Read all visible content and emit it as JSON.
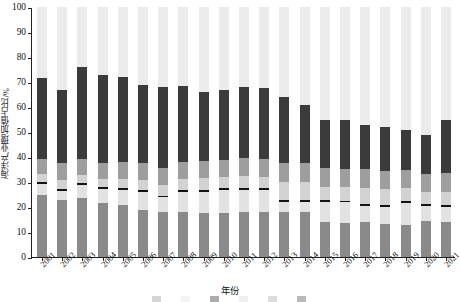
{
  "chart_data": {
    "type": "bar",
    "subtype": "stacked-bar-100",
    "title": "",
    "xlabel": "年份",
    "ylabel": "海洋产业增加值占比/%",
    "ylim": [
      0,
      100
    ],
    "ytick_labels": [
      "0",
      "10",
      "20",
      "30",
      "40",
      "50",
      "60",
      "70",
      "80",
      "90",
      "100"
    ],
    "ytick_values": [
      0,
      10,
      20,
      30,
      40,
      50,
      60,
      70,
      80,
      90,
      100
    ],
    "grid": false,
    "legend_position": "bottom",
    "legend_note": "legend row is cropped off the bottom edge of the screenshot and is illegible",
    "categories": [
      "2001",
      "2002",
      "2003",
      "2004",
      "2005",
      "2006",
      "2007",
      "2008",
      "2009",
      "2010",
      "2011",
      "2012",
      "2013",
      "2014",
      "2015",
      "2016",
      "2017",
      "2018",
      "2019",
      "2020",
      "2021"
    ],
    "series": [
      {
        "name": "series-1",
        "color": "#8a8a8a",
        "values": [
          24.8,
          22.9,
          23.7,
          21.5,
          20.7,
          18.7,
          18.1,
          18.2,
          17.6,
          17.8,
          17.9,
          18.2,
          18.0,
          18.1,
          13.9,
          13.8,
          13.9,
          13.4,
          12.7,
          14.6,
          14.2
        ]
      },
      {
        "name": "series-2",
        "color": "#e2e2e2",
        "values": [
          4.6,
          3.6,
          5.3,
          5.7,
          6.2,
          7.5,
          5.8,
          8.0,
          8.6,
          8.9,
          9.0,
          8.6,
          4.1,
          4.0,
          8.2,
          8.1,
          6.6,
          6.7,
          9.1,
          6.0,
          6.0
        ]
      },
      {
        "name": "series-3",
        "color": "#141414",
        "values": [
          0.8,
          0.8,
          0.8,
          0.8,
          0.8,
          0.6,
          0.6,
          0.6,
          0.7,
          0.8,
          0.8,
          0.8,
          0.7,
          0.7,
          0.7,
          0.7,
          0.7,
          0.6,
          0.7,
          0.7,
          0.7
        ]
      },
      {
        "name": "series-4",
        "color": "#d2d2d2",
        "values": [
          3.2,
          3.6,
          3.1,
          3.2,
          3.6,
          4.0,
          4.2,
          4.3,
          4.6,
          4.5,
          4.6,
          4.6,
          7.4,
          7.4,
          5.2,
          5.3,
          6.6,
          6.5,
          5.0,
          4.8,
          5.3
        ]
      },
      {
        "name": "series-5",
        "color": "#9e9e9e",
        "values": [
          5.9,
          6.6,
          6.5,
          6.4,
          6.9,
          6.8,
          7.0,
          7.1,
          6.8,
          7.0,
          7.2,
          7.1,
          7.5,
          7.4,
          7.6,
          7.5,
          7.5,
          7.4,
          7.2,
          7.3,
          7.6
        ]
      },
      {
        "name": "series-6",
        "color": "#3b3b3b",
        "values": [
          32.2,
          29.5,
          36.6,
          35.4,
          33.8,
          31.4,
          32.3,
          30.3,
          27.7,
          28.0,
          28.5,
          28.5,
          26.3,
          23.4,
          19.4,
          19.6,
          17.7,
          17.4,
          16.3,
          15.6,
          21.2
        ]
      },
      {
        "name": "series-7",
        "color": "#ebebeb",
        "values": [
          28.5,
          33.0,
          24.0,
          27.0,
          28.0,
          31.0,
          32.0,
          31.5,
          34.0,
          33.0,
          32.0,
          32.2,
          36.0,
          39.0,
          45.0,
          45.0,
          47.0,
          48.0,
          49.0,
          51.0,
          45.0
        ]
      }
    ],
    "bar_totals_top_dark": [
      71.5,
      67.0,
      76.0,
      73.0,
      71.5,
      69.0,
      68.0,
      68.5,
      66.0,
      67.0,
      68.0,
      67.8,
      64.0,
      61.0,
      55.0,
      55.0,
      53.0,
      52.0,
      51.0,
      49.0,
      55.0
    ]
  },
  "axes": {
    "y_title": "海洋产业增加值占比/%",
    "x_title": "年份"
  }
}
